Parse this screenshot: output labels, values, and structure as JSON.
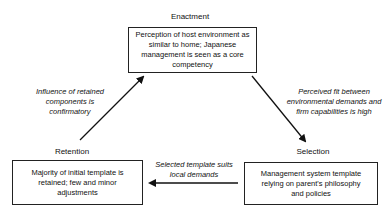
{
  "stages": {
    "enactment": {
      "label": "Enactment",
      "box_text": "Perception of host environment as similar to home; Japanese management is seen as a core competency"
    },
    "selection": {
      "label": "Selection",
      "box_text": "Management system template relying on parent's philosophy and policies"
    },
    "retention": {
      "label": "Retention",
      "box_text": "Majority of initial template is retained; few and minor adjustments"
    }
  },
  "transitions": {
    "enactment_to_selection": "Perceived fit between environmental demands and firm capabilities is high",
    "selection_to_retention": "Selected template suits local demands",
    "retention_to_enactment": "Influence of retained components is confirmatory"
  },
  "colors": {
    "line": "#111111",
    "background": "#ffffff"
  }
}
